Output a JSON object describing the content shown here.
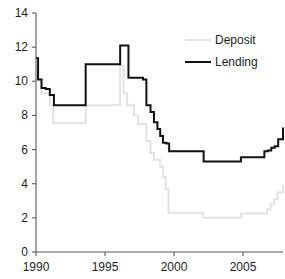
{
  "chart_data": {
    "type": "line",
    "title": "",
    "subtitle": "",
    "xlabel": "",
    "ylabel": "",
    "xlim": [
      1990.0,
      2007.9
    ],
    "ylim": [
      0,
      14
    ],
    "grid": false,
    "legend_position": "top-right",
    "step_style": "post",
    "y_ticks": [
      0,
      2,
      4,
      6,
      8,
      10,
      12,
      14
    ],
    "y_tick_labels": [
      "0",
      "2",
      "4",
      "6",
      "8",
      "10",
      "12",
      "14"
    ],
    "x_ticks": [
      1990,
      1995,
      2000,
      2005
    ],
    "x_tick_labels": [
      "1990",
      "1995",
      "2000",
      "2005"
    ],
    "series": [
      {
        "name": "Deposit",
        "color": "#e3e3e3",
        "line_width": 2.0,
        "x": [
          1990.0,
          1990.15,
          1990.4,
          1990.7,
          1991.0,
          1991.25,
          1993.35,
          1993.6,
          1995.9,
          1996.1,
          1996.35,
          1996.6,
          1996.85,
          1997.1,
          1997.4,
          1997.75,
          1998.0,
          1998.3,
          1998.55,
          1998.8,
          1999.0,
          1999.2,
          1999.4,
          1999.6,
          2001.9,
          2002.1,
          2004.6,
          2004.85,
          2006.5,
          2006.75,
          2007.0,
          2007.25,
          2007.5,
          2007.9
        ],
        "y": [
          11.3,
          10.1,
          9.3,
          9.3,
          8.6,
          7.55,
          7.55,
          8.6,
          8.6,
          10.9,
          9.3,
          8.6,
          8.6,
          8.0,
          7.5,
          7.5,
          6.5,
          5.8,
          5.4,
          5.4,
          5.0,
          4.4,
          3.7,
          2.3,
          2.3,
          2.0,
          2.0,
          2.25,
          2.25,
          2.5,
          2.8,
          3.1,
          3.5,
          3.9
        ]
      },
      {
        "name": "Lending",
        "color": "#111111",
        "line_width": 2.0,
        "x": [
          1990.0,
          1990.15,
          1990.4,
          1990.7,
          1991.0,
          1991.3,
          1993.35,
          1993.6,
          1995.9,
          1996.1,
          1996.45,
          1996.7,
          1997.4,
          1997.75,
          1998.0,
          1998.3,
          1998.55,
          1998.8,
          1999.0,
          1999.2,
          1999.45,
          1999.65,
          2001.9,
          2002.15,
          2004.6,
          2004.85,
          2006.3,
          2006.55,
          2006.8,
          2007.05,
          2007.3,
          2007.55,
          2007.9
        ],
        "y": [
          11.35,
          10.1,
          9.6,
          9.55,
          9.2,
          8.6,
          8.6,
          11.0,
          11.0,
          12.1,
          12.1,
          10.2,
          10.2,
          10.1,
          8.6,
          8.2,
          7.6,
          7.2,
          6.8,
          6.4,
          6.35,
          5.9,
          5.9,
          5.3,
          5.3,
          5.55,
          5.55,
          5.9,
          5.95,
          6.1,
          6.2,
          6.6,
          7.3
        ]
      }
    ]
  },
  "legend": {
    "items": [
      {
        "label": "Deposit",
        "color": "#e3e3e3"
      },
      {
        "label": "Lending",
        "color": "#111111"
      }
    ]
  },
  "axes": {
    "y_axis_name": "rate-axis",
    "x_axis_name": "year-axis"
  }
}
